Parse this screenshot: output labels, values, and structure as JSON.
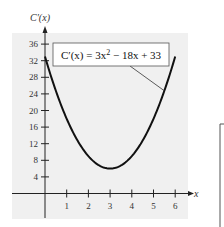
{
  "chart_data": {
    "type": "line",
    "title": "",
    "xlabel": "x",
    "ylabel": "C′(x)",
    "xlim": [
      -1.5,
      6.5
    ],
    "ylim": [
      -6,
      38
    ],
    "x_ticks": [
      1,
      2,
      3,
      4,
      5,
      6
    ],
    "x_tick_labels": [
      "1",
      "2",
      "3",
      "4",
      "5",
      "6"
    ],
    "y_ticks": [
      4,
      8,
      12,
      16,
      20,
      24,
      28,
      32,
      36
    ],
    "y_tick_labels": [
      "4",
      "8",
      "12",
      "16",
      "20",
      "24",
      "28",
      "32",
      "36"
    ],
    "grid": false,
    "series": [
      {
        "name": "C′(x) = 3x² − 18x + 33",
        "function": "3x^2 - 18x + 33",
        "coefficients": [
          3,
          -18,
          33
        ],
        "x_range": [
          0,
          6
        ],
        "key_points": [
          {
            "x": 0,
            "y": 33
          },
          {
            "x": 1,
            "y": 18
          },
          {
            "x": 2,
            "y": 9
          },
          {
            "x": 3,
            "y": 6
          },
          {
            "x": 4,
            "y": 9
          },
          {
            "x": 5,
            "y": 18
          },
          {
            "x": 6,
            "y": 33
          }
        ]
      }
    ],
    "annotation": {
      "text_prefix": "C′(x) = 3x",
      "text_sup": "2",
      "text_suffix": " − 18x + 33",
      "points_to_x": 5.5
    }
  }
}
